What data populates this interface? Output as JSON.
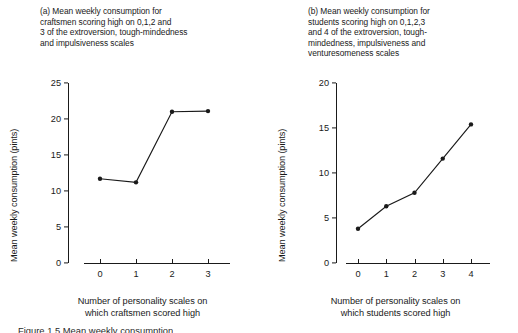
{
  "figure": {
    "caption": "Figure 1.5 Mean weekly consumption"
  },
  "panels": [
    {
      "id": "a",
      "title_lines": [
        "(a) Mean weekly consumption for",
        "craftsmen scoring high on 0,1,2 and",
        "3 of the extroversion, tough-mindedness",
        "and impulsiveness scales"
      ],
      "ylabel": "Mean weekly consumption (pints)",
      "xlabel_lines": [
        "Number of personality scales on",
        "which craftsmen scored high"
      ],
      "yticks": [
        "0",
        "5",
        "10",
        "15",
        "20",
        "25"
      ],
      "xticks": [
        "0",
        "1",
        "2",
        "3"
      ]
    },
    {
      "id": "b",
      "title_lines": [
        "(b) Mean weekly consumption for",
        "students scoring high on 0,1,2,3",
        "and 4 of the extroversion, tough-",
        "mindedness, impulsiveness and",
        "venturesomeness scales"
      ],
      "ylabel": "Mean weekly consumption (pints)",
      "xlabel_lines": [
        "Number of personality scales on",
        "which students scored high"
      ],
      "yticks": [
        "0",
        "5",
        "10",
        "15",
        "20"
      ],
      "xticks": [
        "0",
        "1",
        "2",
        "3",
        "4"
      ]
    }
  ],
  "chart_data": [
    {
      "type": "line",
      "panel": "a",
      "title": "(a) Mean weekly consumption for craftsmen scoring high on 0,1,2 and 3 of the extroversion, tough-mindedness and impulsiveness scales",
      "xlabel": "Number of personality scales on which craftsmen scored high",
      "ylabel": "Mean weekly consumption (pints)",
      "categories": [
        0,
        1,
        2,
        3
      ],
      "x": [
        0,
        1,
        2,
        3
      ],
      "values": [
        11.7,
        11.2,
        21.0,
        21.1
      ],
      "xlim": [
        0,
        3
      ],
      "ylim": [
        0,
        25
      ],
      "ytick_values": [
        0,
        5,
        10,
        15,
        20,
        25
      ],
      "xtick_values": [
        0,
        1,
        2,
        3
      ],
      "grid": false,
      "legend": false,
      "marker": "filled-circle",
      "line_color": "#1a1a1a"
    },
    {
      "type": "line",
      "panel": "b",
      "title": "(b) Mean weekly consumption for students scoring high on 0,1,2,3 and 4 of the extroversion, tough-mindedness, impulsiveness and venturesomeness scales",
      "xlabel": "Number of personality scales on which students scored high",
      "ylabel": "Mean weekly consumption (pints)",
      "categories": [
        0,
        1,
        2,
        3,
        4
      ],
      "x": [
        0,
        1,
        2,
        3,
        4
      ],
      "values": [
        3.8,
        6.3,
        7.8,
        11.6,
        15.4
      ],
      "xlim": [
        0,
        4
      ],
      "ylim": [
        0,
        20
      ],
      "ytick_values": [
        0,
        5,
        10,
        15,
        20
      ],
      "xtick_values": [
        0,
        1,
        2,
        3,
        4
      ],
      "grid": false,
      "legend": false,
      "marker": "filled-circle",
      "line_color": "#1a1a1a"
    }
  ]
}
